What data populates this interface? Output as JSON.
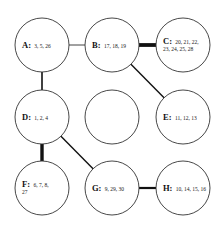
{
  "diagram": {
    "nodes": [
      {
        "id": "A",
        "label": "A:",
        "values": "3, 5, 26",
        "line2": "",
        "cx": 42,
        "cy": 45
      },
      {
        "id": "B",
        "label": "B:",
        "values": "17, 18, 19",
        "line2": "",
        "cx": 112,
        "cy": 45
      },
      {
        "id": "C",
        "label": "C:",
        "values": "20,  21,  22,",
        "line2": "23, 24, 25, 28",
        "cx": 183,
        "cy": 45
      },
      {
        "id": "D",
        "label": "D:",
        "values": "1, 2, 4",
        "line2": "",
        "cx": 42,
        "cy": 117
      },
      {
        "id": "empty",
        "label": "",
        "values": "",
        "line2": "",
        "cx": 112,
        "cy": 117
      },
      {
        "id": "E",
        "label": "E:",
        "values": "11, 12, 13",
        "line2": "",
        "cx": 183,
        "cy": 117
      },
      {
        "id": "F",
        "label": "F:",
        "values": "6,  7,  8,",
        "line2": "27",
        "cx": 42,
        "cy": 188
      },
      {
        "id": "G",
        "label": "G:",
        "values": "9, 29, 30",
        "line2": "",
        "cx": 112,
        "cy": 188
      },
      {
        "id": "H",
        "label": "H:",
        "values": "10, 14, 15, 16",
        "line2": "",
        "cx": 183,
        "cy": 188
      }
    ],
    "radius": 27,
    "edges": [
      {
        "from": "A",
        "to": "B",
        "weight": "thin",
        "width": 0.8
      },
      {
        "from": "A",
        "to": "D",
        "weight": "medium",
        "width": 1.6
      },
      {
        "from": "B",
        "to": "C",
        "weight": "thick",
        "width": 3.8
      },
      {
        "from": "B",
        "to": "E",
        "weight": "medium",
        "width": 1.4
      },
      {
        "from": "D",
        "to": "F",
        "weight": "thick",
        "width": 3.4
      },
      {
        "from": "D",
        "to": "G",
        "weight": "medium",
        "width": 1.4
      },
      {
        "from": "G",
        "to": "H",
        "weight": "medium-thick",
        "width": 2.2
      }
    ]
  }
}
